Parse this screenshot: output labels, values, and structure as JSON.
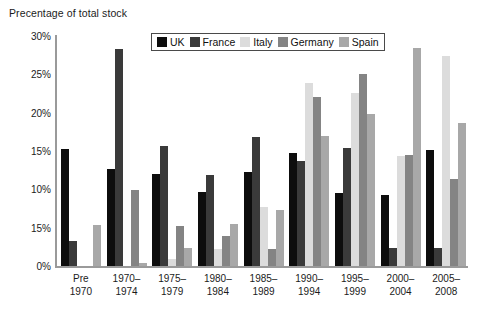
{
  "chart_data": {
    "type": "bar",
    "title": "Precentage of total stock",
    "xlabel": "",
    "ylabel": "",
    "ylim": [
      0,
      30
    ],
    "grid": false,
    "legend_position": "top-center",
    "y_ticks": [
      {
        "value": 30,
        "label": "30%"
      },
      {
        "value": 25,
        "label": "25%"
      },
      {
        "value": 20,
        "label": "20%"
      },
      {
        "value": 15,
        "label": "15%"
      },
      {
        "value": 10,
        "label": "10%"
      },
      {
        "value": 5,
        "label": "15%"
      },
      {
        "value": 0,
        "label": "0%"
      }
    ],
    "categories": [
      "Pre\n1970",
      "1970–\n1974",
      "1975–\n1979",
      "1980–\n1984",
      "1985–\n1989",
      "1990–\n1994",
      "1995–\n1999",
      "2000–\n2004",
      "2005–\n2008"
    ],
    "category_lines": [
      [
        "Pre",
        "1970"
      ],
      [
        "1970–",
        "1974"
      ],
      [
        "1975–",
        "1979"
      ],
      [
        "1980–",
        "1984"
      ],
      [
        "1985–",
        "1989"
      ],
      [
        "1990–",
        "1994"
      ],
      [
        "1995–",
        "1999"
      ],
      [
        "2000–",
        "2004"
      ],
      [
        "2005–",
        "2008"
      ]
    ],
    "series": [
      {
        "name": "UK",
        "key": "uk",
        "color": "#0d0d0d",
        "values": [
          15.3,
          12.6,
          12.0,
          9.7,
          12.2,
          14.7,
          9.5,
          9.3,
          15.1
        ]
      },
      {
        "name": "France",
        "key": "france",
        "color": "#3a3a3a",
        "values": [
          3.3,
          28.3,
          15.7,
          11.9,
          16.8,
          13.7,
          15.4,
          2.4,
          2.4
        ]
      },
      {
        "name": "Italy",
        "key": "italy",
        "color": "#dcdcdc",
        "values": [
          0,
          0,
          0.9,
          2.2,
          7.7,
          23.9,
          22.6,
          14.3,
          27.4
        ]
      },
      {
        "name": "Germany",
        "key": "germany",
        "color": "#848484",
        "values": [
          0,
          9.9,
          5.2,
          3.9,
          2.2,
          22.1,
          25.0,
          14.5,
          11.4
        ]
      },
      {
        "name": "Spain",
        "key": "spain",
        "color": "#a8a8a8",
        "values": [
          5.4,
          0.4,
          2.3,
          5.5,
          7.3,
          17.0,
          19.8,
          28.4,
          18.7
        ]
      }
    ]
  }
}
